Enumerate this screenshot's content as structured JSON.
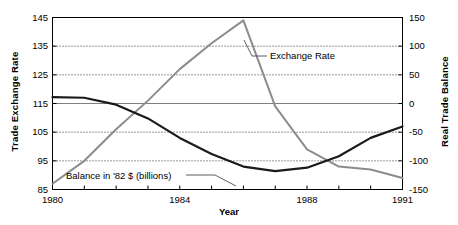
{
  "chart_data": {
    "type": "line",
    "title": "",
    "xlabel": "Year",
    "ylabel": "Trade Exchange Rate",
    "ylabel_right": "Real Trade Balance",
    "xlim": [
      1980,
      1991
    ],
    "ylim": [
      85,
      145
    ],
    "ylim_right": [
      -150,
      150
    ],
    "grid": true,
    "grid_style": "dotted",
    "gridlines_left": [
      135,
      125,
      105,
      95
    ],
    "zero_line_left_value": 115,
    "zero_line_right_value": 0,
    "legend": "annotations",
    "xticks": [
      1980,
      1981,
      1982,
      1983,
      1984,
      1985,
      1986,
      1987,
      1988,
      1989,
      1990,
      1991
    ],
    "xtick_labels": [
      {
        "value": 1980,
        "label": "1980"
      },
      {
        "value": 1984,
        "label": "1984"
      },
      {
        "value": 1988,
        "label": "1988"
      },
      {
        "value": 1991,
        "label": "1991"
      }
    ],
    "yticks_left": [
      145,
      135,
      125,
      115,
      105,
      95,
      85
    ],
    "ytick_labels_left": [
      "145",
      "135",
      "125",
      "115",
      "105",
      "95",
      "85"
    ],
    "yticks_right": [
      150,
      100,
      50,
      0,
      -50,
      -100,
      -150
    ],
    "ytick_labels_right": [
      "150",
      "100",
      "50",
      "0",
      "-50",
      "-100",
      "-150"
    ],
    "x": [
      1980,
      1981,
      1982,
      1983,
      1984,
      1985,
      1986,
      1987,
      1988,
      1989,
      1990,
      1991
    ],
    "series": [
      {
        "name": "Exchange Rate",
        "axis": "left",
        "color": "#8c8c8c",
        "values": [
          87,
          95,
          106,
          116,
          127,
          136,
          144,
          114,
          99,
          93,
          92,
          89
        ]
      },
      {
        "name": "Balance in '82 $ (billions)",
        "axis": "right",
        "color": "#1a1a1a",
        "values": [
          11,
          10,
          -2,
          -26,
          -60,
          -88,
          -110,
          -118,
          -112,
          -92,
          -60,
          -40
        ]
      }
    ],
    "annotations": [
      {
        "text": "Exchange Rate",
        "id": "annot-exchange"
      },
      {
        "text": "Balance in '82 $ (billions)",
        "id": "annot-balance"
      }
    ],
    "colors": {
      "exchange_rate": "#8c8c8c",
      "trade_balance": "#1a1a1a",
      "grid": "#333333",
      "zero_line": "#808080",
      "frame": "#000000",
      "background": "#ffffff"
    }
  }
}
